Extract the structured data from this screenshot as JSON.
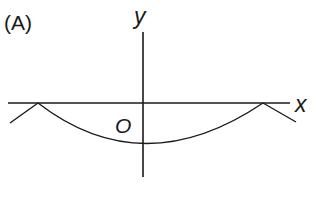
{
  "figure": {
    "panel_label": "(A)",
    "x_axis_label": "x",
    "y_axis_label": "y",
    "origin_label": "O"
  },
  "colors": {
    "stroke": "#1a1a1a",
    "background": "#ffffff"
  }
}
